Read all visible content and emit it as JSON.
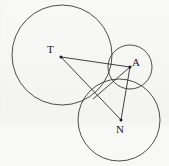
{
  "figure": {
    "kind": "geometry-diagram",
    "stroke_color": "#3a3a3a",
    "label_color": "#1a1a1a",
    "background_color": "#f8f8f7",
    "canvas": {
      "width": 169,
      "height": 166
    },
    "labels": {
      "t": "T",
      "a": "A",
      "n": "N"
    },
    "circles": [
      {
        "name": "circle-T",
        "cx": 62,
        "cy": 55,
        "r": 50
      },
      {
        "name": "circle-A",
        "cx": 130,
        "cy": 67,
        "r": 22
      },
      {
        "name": "circle-N",
        "cx": 119,
        "cy": 120,
        "r": 41
      }
    ],
    "points": [
      {
        "name": "point-T",
        "x": 61,
        "y": 57
      },
      {
        "name": "point-A",
        "x": 130,
        "y": 67
      },
      {
        "name": "point-N",
        "x": 121,
        "y": 120
      },
      {
        "name": "point-tangent-TA",
        "x": 110,
        "y": 64
      },
      {
        "name": "point-tangent-TN",
        "x": 97,
        "y": 92
      },
      {
        "name": "point-tangent-AN",
        "x": 127,
        "y": 89
      }
    ],
    "segments": [
      {
        "name": "segment-T-A",
        "x1": 61,
        "y1": 57,
        "x2": 130,
        "y2": 67
      },
      {
        "name": "segment-T-N",
        "x1": 61,
        "y1": 57,
        "x2": 121,
        "y2": 120
      },
      {
        "name": "segment-A-N",
        "x1": 130,
        "y1": 67,
        "x2": 121,
        "y2": 120
      },
      {
        "name": "segment-A-tangent-TN",
        "x1": 130,
        "y1": 67,
        "x2": 93,
        "y2": 99
      }
    ]
  }
}
